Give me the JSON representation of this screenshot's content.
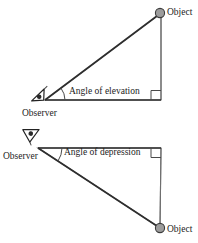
{
  "figure": {
    "elevation": {
      "object_label": "Object",
      "angle_label": "Angle of elevation",
      "observer_label": "Observer"
    },
    "depression": {
      "observer_label": "Observer",
      "angle_label": "Angle of depression",
      "object_label": "Object"
    }
  },
  "colors": {
    "background": "#ffffff",
    "triangle_fill": "#ebebeb",
    "outline": "#2e2e2e",
    "vertical_edge": "#6f6f6f",
    "object_dot_fill": "#9c9c9c",
    "object_dot_stroke": "#3c3c3c",
    "text": "#1c1c1c"
  }
}
